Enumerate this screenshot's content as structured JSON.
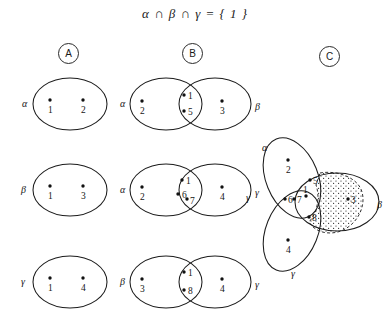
{
  "figure": {
    "title": "α ∩ β ∩ γ = { 1 }",
    "columns": [
      {
        "id": "A",
        "label": "A"
      },
      {
        "id": "B",
        "label": "B"
      },
      {
        "id": "C",
        "label": "C"
      }
    ],
    "column_a": {
      "rows": [
        {
          "set_label": "α",
          "points": [
            {
              "value": "1"
            },
            {
              "value": "2"
            }
          ]
        },
        {
          "set_label": "β",
          "points": [
            {
              "value": "1"
            },
            {
              "value": "3"
            }
          ]
        },
        {
          "set_label": "γ",
          "points": [
            {
              "value": "1"
            },
            {
              "value": "4"
            }
          ]
        }
      ]
    },
    "column_b": {
      "rows": [
        {
          "left_label": "α",
          "right_label": "β",
          "left_only": [
            {
              "value": "2"
            }
          ],
          "intersection": [
            {
              "value": "1"
            },
            {
              "value": "5"
            }
          ],
          "right_only": [
            {
              "value": "3"
            }
          ]
        },
        {
          "left_label": "α",
          "right_label": "γ",
          "left_only": [
            {
              "value": "2"
            }
          ],
          "intersection": [
            {
              "value": "1"
            },
            {
              "value": "6"
            },
            {
              "value": "7"
            }
          ],
          "right_only": [
            {
              "value": "4"
            }
          ]
        },
        {
          "left_label": "β",
          "right_label": "γ",
          "left_only": [
            {
              "value": "3"
            }
          ],
          "intersection": [
            {
              "value": "1"
            },
            {
              "value": "8"
            }
          ],
          "right_only": [
            {
              "value": "4"
            }
          ]
        }
      ]
    },
    "column_c": {
      "labels": {
        "alpha": "α",
        "beta": "β",
        "gamma_left": "γ",
        "gamma_bottom": "γ"
      },
      "points": [
        {
          "value": "2",
          "region": "alpha-only"
        },
        {
          "value": "5",
          "region": "alpha-beta"
        },
        {
          "value": "6",
          "region": "alpha-gamma"
        },
        {
          "value": "7",
          "region": "alpha-gamma"
        },
        {
          "value": "1",
          "region": "alpha-beta-gamma"
        },
        {
          "value": "8",
          "region": "beta-gamma"
        },
        {
          "value": "3",
          "region": "beta-only"
        },
        {
          "value": "4",
          "region": "gamma-only"
        }
      ],
      "shaded_region": "beta"
    },
    "colors": {
      "ink": "#1c1c1c",
      "background": "#ffffff"
    }
  }
}
